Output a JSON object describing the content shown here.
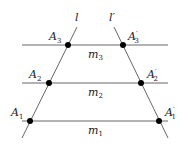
{
  "diagram": {
    "line_color": "#666666",
    "point_color": "#000000",
    "transversals": [
      {
        "id": "l",
        "label": "l",
        "from": [
          22,
          138
        ],
        "to": [
          77,
          27
        ]
      },
      {
        "id": "lp",
        "label": "l′",
        "from": [
          168,
          138
        ],
        "to": [
          114,
          27
        ]
      }
    ],
    "parallels": [
      {
        "id": "m3",
        "label": "m",
        "sub": "3",
        "y": 45,
        "x1": 22,
        "x2": 168,
        "label_pos": [
          88,
          58
        ]
      },
      {
        "id": "m2",
        "label": "m",
        "sub": "2",
        "y": 83,
        "x1": 22,
        "x2": 168,
        "label_pos": [
          88,
          96
        ]
      },
      {
        "id": "m1",
        "label": "m",
        "sub": "1",
        "y": 121,
        "x1": 22,
        "x2": 168,
        "label_pos": [
          88,
          134
        ]
      }
    ],
    "points": [
      {
        "id": "A3",
        "label": "A",
        "sub": "3",
        "prime": "",
        "x": 68,
        "y": 45,
        "label_pos": [
          49,
          40
        ]
      },
      {
        "id": "A3p",
        "label": "A",
        "sub": "3",
        "prime": "′",
        "x": 123,
        "y": 45,
        "label_pos": [
          128,
          40
        ]
      },
      {
        "id": "A2",
        "label": "A",
        "sub": "2",
        "prime": "",
        "x": 49,
        "y": 83,
        "label_pos": [
          29,
          78
        ]
      },
      {
        "id": "A2p",
        "label": "A",
        "sub": "2",
        "prime": "′",
        "x": 141,
        "y": 83,
        "label_pos": [
          147,
          78
        ]
      },
      {
        "id": "A1",
        "label": "A",
        "sub": "1",
        "prime": "",
        "x": 30,
        "y": 121,
        "label_pos": [
          11,
          116
        ]
      },
      {
        "id": "A1p",
        "label": "A",
        "sub": "1",
        "prime": "′",
        "x": 159,
        "y": 121,
        "label_pos": [
          165,
          116
        ]
      }
    ],
    "line_labels": {
      "l": {
        "text": "l",
        "pos": [
          75,
          21
        ]
      },
      "lp": {
        "text": "l′",
        "pos": [
          109,
          21
        ]
      }
    }
  }
}
